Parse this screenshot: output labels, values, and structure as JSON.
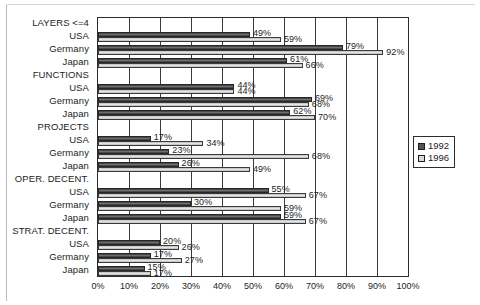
{
  "chart_data": {
    "type": "bar",
    "orientation": "horizontal",
    "title": "",
    "xlabel": "",
    "ylabel": "",
    "xlim": [
      0,
      100
    ],
    "xticks": [
      "0%",
      "10%",
      "20%",
      "30%",
      "40%",
      "50%",
      "60%",
      "70%",
      "80%",
      "90%",
      "100%"
    ],
    "grid": true,
    "legend_position": "right",
    "legend": [
      "1992",
      "1996"
    ],
    "series": [
      {
        "name": "1992",
        "color": "#555555"
      },
      {
        "name": "1996",
        "color": "#d8d8d8"
      }
    ],
    "groups": [
      {
        "group_label": "LAYERS <=4",
        "rows": [
          {
            "label": "USA",
            "v1992": 49,
            "v1996": 59,
            "l1992": "49%",
            "l1996": "59%"
          },
          {
            "label": "Germany",
            "v1992": 79,
            "v1996": 92,
            "l1992": "79%",
            "l1996": "92%"
          },
          {
            "label": "Japan",
            "v1992": 61,
            "v1996": 66,
            "l1992": "61%",
            "l1996": "66%"
          }
        ]
      },
      {
        "group_label": "FUNCTIONS",
        "rows": [
          {
            "label": "USA",
            "v1992": 44,
            "v1996": 44,
            "l1992": "44%",
            "l1996": "44%"
          },
          {
            "label": "Germany",
            "v1992": 69,
            "v1996": 68,
            "l1992": "69%",
            "l1996": "68%"
          },
          {
            "label": "Japan",
            "v1992": 62,
            "v1996": 70,
            "l1992": "62%",
            "l1996": "70%"
          }
        ]
      },
      {
        "group_label": "PROJECTS",
        "rows": [
          {
            "label": "USA",
            "v1992": 17,
            "v1996": 34,
            "l1992": "17%",
            "l1996": "34%"
          },
          {
            "label": "Germany",
            "v1992": 23,
            "v1996": 68,
            "l1992": "23%",
            "l1996": "68%"
          },
          {
            "label": "Japan",
            "v1992": 26,
            "v1996": 49,
            "l1992": "26%",
            "l1996": "49%"
          }
        ]
      },
      {
        "group_label": "OPER. DECENT.",
        "rows": [
          {
            "label": "USA",
            "v1992": 55,
            "v1996": 67,
            "l1992": "55%",
            "l1996": "67%"
          },
          {
            "label": "Germany",
            "v1992": 30,
            "v1996": 59,
            "l1992": "30%",
            "l1996": "59%"
          },
          {
            "label": "Japan",
            "v1992": 59,
            "v1996": 67,
            "l1992": "59%",
            "l1996": "67%"
          }
        ]
      },
      {
        "group_label": "STRAT. DECENT.",
        "rows": [
          {
            "label": "USA",
            "v1992": 20,
            "v1996": 26,
            "l1992": "20%",
            "l1996": "26%"
          },
          {
            "label": "Germany",
            "v1992": 17,
            "v1996": 27,
            "l1992": "17%",
            "l1996": "27%"
          },
          {
            "label": "Japan",
            "v1992": 15,
            "v1996": 17,
            "l1992": "15%",
            "l1996": "17%"
          }
        ]
      }
    ]
  }
}
